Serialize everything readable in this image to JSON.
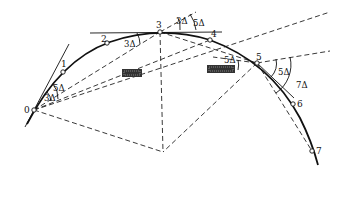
{
  "diagram": {
    "type": "circular curve setting-out by deflection angles",
    "points": [
      {
        "id": "0",
        "label": "0",
        "x": 34,
        "y": 110
      },
      {
        "id": "1",
        "label": "1",
        "x": 63,
        "y": 72
      },
      {
        "id": "2",
        "label": "2",
        "x": 107,
        "y": 43
      },
      {
        "id": "3",
        "label": "3",
        "x": 160,
        "y": 32
      },
      {
        "id": "4",
        "label": "4",
        "x": 210,
        "y": 40
      },
      {
        "id": "5",
        "label": "5",
        "x": 257,
        "y": 63
      },
      {
        "id": "6",
        "label": "6",
        "x": 293,
        "y": 104
      },
      {
        "id": "7",
        "label": "7",
        "x": 312,
        "y": 151
      }
    ],
    "center": {
      "x": 163,
      "y": 152
    },
    "angle_labels": [
      {
        "text": "3Δ",
        "x": 44,
        "y": 101
      },
      {
        "text": "5Δ",
        "x": 55,
        "y": 91
      },
      {
        "text": "3Δ",
        "x": 124,
        "y": 47
      },
      {
        "text": "3Δ",
        "x": 176,
        "y": 24
      },
      {
        "text": "5Δ",
        "x": 193,
        "y": 26
      },
      {
        "text": "5Δ",
        "x": 226,
        "y": 63
      },
      {
        "text": "5Δ",
        "x": 277,
        "y": 74
      },
      {
        "text": "7Δ",
        "x": 298,
        "y": 87
      }
    ],
    "obstacles": [
      {
        "name": "obstacle-left",
        "x": 122,
        "y": 69,
        "w": 20,
        "h": 8
      },
      {
        "name": "obstacle-right",
        "x": 207,
        "y": 65,
        "w": 28,
        "h": 8
      }
    ]
  }
}
